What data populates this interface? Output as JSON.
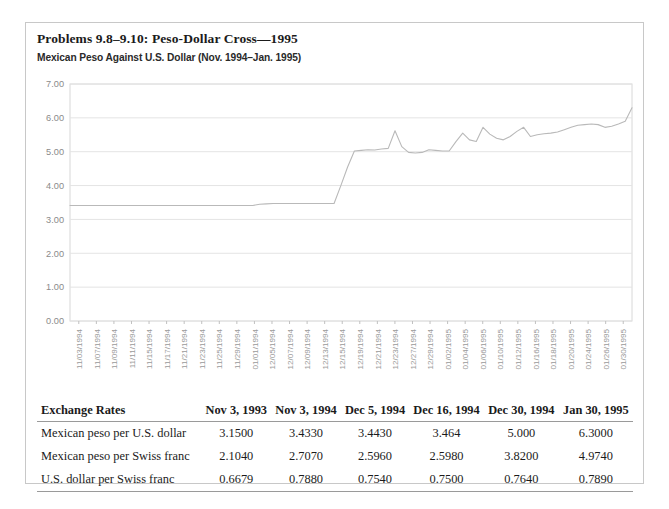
{
  "figure": {
    "title": "Problems 9.8–9.10: Peso-Dollar Cross—1995"
  },
  "chart_data": {
    "type": "line",
    "title": "Mexican Peso Against U.S. Dollar (Nov. 1994–Jan. 1995)",
    "xlabel": "",
    "ylabel": "",
    "ylim": [
      0.0,
      7.0
    ],
    "ytick_labels": [
      "7.00",
      "6.00",
      "5.00",
      "4.00",
      "3.00",
      "2.00",
      "1.00",
      "0.00"
    ],
    "ytick_values": [
      7.0,
      6.0,
      5.0,
      4.0,
      3.0,
      2.0,
      1.0,
      0.0
    ],
    "grid": true,
    "legend": "none",
    "line_color": "#b9b9b9",
    "categories": [
      "11/03/1994",
      "11/07/1994",
      "11/09/1994",
      "11/11/1994",
      "11/15/1994",
      "11/17/1994",
      "11/21/1994",
      "11/23/1994",
      "11/25/1994",
      "11/29/1994",
      "01/01/1994",
      "12/05/1994",
      "12/07/1994",
      "12/09/1994",
      "12/13/1994",
      "12/15/1994",
      "12/19/1994",
      "12/21/1994",
      "12/23/1994",
      "12/27/1994",
      "12/29/1994",
      "01/02/1995",
      "01/04/1995",
      "01/06/1995",
      "01/10/1995",
      "01/12/1995",
      "01/16/1995",
      "01/18/1995",
      "01/20/1995",
      "01/24/1995",
      "01/26/1995",
      "01/30/1995"
    ],
    "values": [
      3.41,
      3.41,
      3.41,
      3.41,
      3.41,
      3.41,
      3.42,
      3.42,
      3.42,
      3.43,
      3.43,
      3.44,
      3.44,
      3.44,
      3.45,
      3.46,
      3.47,
      4.55,
      5.05,
      5.1,
      5.62,
      5.0,
      4.96,
      5.05,
      5.02,
      5.55,
      5.3,
      5.72,
      5.45,
      5.32,
      5.5,
      6.3
    ],
    "series_detail": [
      3.41,
      3.41,
      3.41,
      3.41,
      3.41,
      3.41,
      3.41,
      3.41,
      3.41,
      3.41,
      3.41,
      3.41,
      3.41,
      3.41,
      3.41,
      3.41,
      3.41,
      3.41,
      3.41,
      3.41,
      3.41,
      3.41,
      3.41,
      3.41,
      3.41,
      3.41,
      3.41,
      3.41,
      3.45,
      3.46,
      3.47,
      3.47,
      3.47,
      3.47,
      3.47,
      3.47,
      3.47,
      3.47,
      3.47,
      3.47,
      4.0,
      4.55,
      5.02,
      5.04,
      5.06,
      5.05,
      5.08,
      5.1,
      5.62,
      5.15,
      4.98,
      4.96,
      4.98,
      5.06,
      5.04,
      5.02,
      5.02,
      5.3,
      5.55,
      5.35,
      5.3,
      5.72,
      5.52,
      5.4,
      5.35,
      5.45,
      5.6,
      5.72,
      5.45,
      5.5,
      5.53,
      5.55,
      5.58,
      5.65,
      5.72,
      5.78,
      5.8,
      5.82,
      5.8,
      5.72,
      5.75,
      5.82,
      5.9,
      6.3
    ]
  },
  "table": {
    "columns": [
      "Exchange Rates",
      "Nov 3, 1993",
      "Nov 3, 1994",
      "Dec 5, 1994",
      "Dec 16, 1994",
      "Dec 30, 1994",
      "Jan 30, 1995"
    ],
    "rows": [
      {
        "label": "Mexican peso per U.S. dollar",
        "values": [
          "3.1500",
          "3.4330",
          "3.4430",
          "3.464",
          "5.000",
          "6.3000"
        ]
      },
      {
        "label": "Mexican peso per Swiss franc",
        "values": [
          "2.1040",
          "2.7070",
          "2.5960",
          "2.5980",
          "3.8200",
          "4.9740"
        ]
      },
      {
        "label": "U.S. dollar per Swiss franc",
        "values": [
          "0.6679",
          "0.7880",
          "0.7540",
          "0.7500",
          "0.7640",
          "0.7890"
        ]
      }
    ]
  }
}
